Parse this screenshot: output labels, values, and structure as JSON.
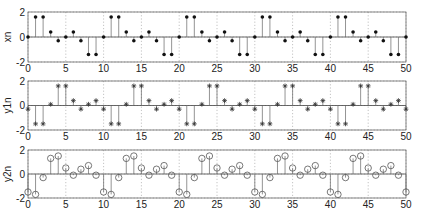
{
  "figure": {
    "width": 421,
    "height": 220,
    "background": "#ffffff",
    "axis_color": "#555555",
    "grid_color": "#9a9a9a",
    "stem_color": "#444444"
  },
  "chart_data": [
    {
      "type": "stem",
      "ylabel": "xn",
      "xlabel": "",
      "title": "",
      "xlim": [
        0,
        50
      ],
      "ylim": [
        -2,
        2
      ],
      "xticks": [
        0,
        5,
        10,
        15,
        20,
        25,
        30,
        35,
        40,
        45,
        50
      ],
      "yticks": [
        -2,
        0,
        2
      ],
      "grid": true,
      "marker": "filled-dot",
      "x": [
        0,
        1,
        2,
        3,
        4,
        5,
        6,
        7,
        8,
        9,
        10,
        11,
        12,
        13,
        14,
        15,
        16,
        17,
        18,
        19,
        20,
        21,
        22,
        23,
        24,
        25,
        26,
        27,
        28,
        29,
        30,
        31,
        32,
        33,
        34,
        35,
        36,
        37,
        38,
        39,
        40,
        41,
        42,
        43,
        44,
        45,
        46,
        47,
        48,
        49,
        50
      ],
      "values": [
        0,
        1.6,
        1.6,
        0.4,
        -0.3,
        0,
        0.4,
        -0.3,
        -1.4,
        -1.4,
        0,
        1.6,
        1.6,
        0.4,
        -0.3,
        0,
        0.4,
        -0.3,
        -1.4,
        -1.4,
        0,
        1.6,
        1.6,
        0.4,
        -0.3,
        0,
        0.4,
        -0.3,
        -1.4,
        -1.4,
        0,
        1.6,
        1.6,
        0.4,
        -0.3,
        0,
        0.4,
        -0.3,
        -1.4,
        -1.4,
        0,
        1.6,
        1.6,
        0.4,
        -0.3,
        0,
        0.4,
        -0.3,
        -1.4,
        -1.4,
        0
      ]
    },
    {
      "type": "stem",
      "ylabel": "y1n",
      "xlabel": "",
      "title": "",
      "xlim": [
        0,
        50
      ],
      "ylim": [
        -2,
        2
      ],
      "xticks": [
        0,
        5,
        10,
        15,
        20,
        25,
        30,
        35,
        40,
        45,
        50
      ],
      "yticks": [
        -2,
        0,
        2
      ],
      "grid": true,
      "marker": "asterisk",
      "x": [
        0,
        1,
        2,
        3,
        4,
        5,
        6,
        7,
        8,
        9,
        10,
        11,
        12,
        13,
        14,
        15,
        16,
        17,
        18,
        19,
        20,
        21,
        22,
        23,
        24,
        25,
        26,
        27,
        28,
        29,
        30,
        31,
        32,
        33,
        34,
        35,
        36,
        37,
        38,
        39,
        40,
        41,
        42,
        43,
        44,
        45,
        46,
        47,
        48,
        49,
        50
      ],
      "values": [
        -0.3,
        -1.5,
        -1.5,
        0.1,
        1.6,
        1.6,
        0.4,
        -0.3,
        0.1,
        0.4,
        -0.3,
        -1.5,
        -1.5,
        0.1,
        1.6,
        1.6,
        0.4,
        -0.3,
        0.1,
        0.4,
        -0.3,
        -1.5,
        -1.5,
        0.1,
        1.6,
        1.6,
        0.4,
        -0.3,
        0.1,
        0.4,
        -0.3,
        -1.5,
        -1.5,
        0.1,
        1.6,
        1.6,
        0.4,
        -0.3,
        0.1,
        0.4,
        -0.3,
        -1.5,
        -1.5,
        0.1,
        1.6,
        1.6,
        0.4,
        -0.3,
        0.1,
        0.4,
        -0.3
      ]
    },
    {
      "type": "stem",
      "ylabel": "y2n",
      "xlabel": "",
      "title": "",
      "xlim": [
        0,
        50
      ],
      "ylim": [
        -2,
        2
      ],
      "xticks": [
        0,
        5,
        10,
        15,
        20,
        25,
        30,
        35,
        40,
        45,
        50
      ],
      "yticks": [
        -2,
        0,
        2
      ],
      "grid": true,
      "marker": "open-circle",
      "x": [
        0,
        1,
        2,
        3,
        4,
        5,
        6,
        7,
        8,
        9,
        10,
        11,
        12,
        13,
        14,
        15,
        16,
        17,
        18,
        19,
        20,
        21,
        22,
        23,
        24,
        25,
        26,
        27,
        28,
        29,
        30,
        31,
        32,
        33,
        34,
        35,
        36,
        37,
        38,
        39,
        40,
        41,
        42,
        43,
        44,
        45,
        46,
        47,
        48,
        49,
        50
      ],
      "values": [
        -1.5,
        -1.7,
        -0.3,
        1.3,
        1.5,
        0.5,
        -0.1,
        0.4,
        0.7,
        -0.1,
        -1.5,
        -1.7,
        -0.3,
        1.3,
        1.5,
        0.5,
        -0.1,
        0.4,
        0.7,
        -0.1,
        -1.5,
        -1.7,
        -0.3,
        1.3,
        1.5,
        0.5,
        -0.1,
        0.4,
        0.7,
        -0.1,
        -1.5,
        -1.7,
        -0.3,
        1.3,
        1.5,
        0.5,
        -0.1,
        0.4,
        0.7,
        -0.1,
        -1.5,
        -1.7,
        -0.3,
        1.3,
        1.5,
        0.5,
        -0.1,
        0.4,
        0.7,
        -0.1,
        -1.5
      ]
    }
  ],
  "layout": {
    "plot_left": 28,
    "plot_right": 406,
    "panels": [
      {
        "top": 12,
        "bottom": 62
      },
      {
        "top": 81,
        "bottom": 130
      },
      {
        "top": 150,
        "bottom": 198
      }
    ]
  }
}
